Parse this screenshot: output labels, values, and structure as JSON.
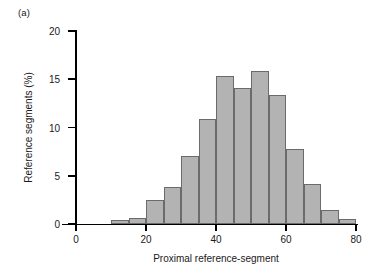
{
  "figure": {
    "panel_label": "(a)",
    "accent_bar_fill": "#b3b3b3",
    "accent_bar_stroke": "#6b6b6b",
    "axis_color": "#000000"
  },
  "chart_data": {
    "type": "bar",
    "title": "",
    "subtitle": "",
    "panel": "(a)",
    "xlabel": "Proximal reference-segment",
    "ylabel": "Reference segments (%)",
    "xlim": [
      0,
      80
    ],
    "ylim": [
      0,
      20
    ],
    "xticks": [
      0,
      20,
      40,
      60,
      80
    ],
    "xtick_labels": [
      "0",
      "20",
      "40",
      "60",
      "80"
    ],
    "yticks": [
      0,
      5,
      10,
      15,
      20
    ],
    "ytick_labels": [
      "0",
      "5",
      "10",
      "15",
      "20"
    ],
    "grid": false,
    "legend": null,
    "bin_width": 5,
    "bin_edges": [
      10,
      15,
      20,
      25,
      30,
      35,
      40,
      45,
      50,
      55,
      60,
      65,
      70,
      75,
      80
    ],
    "categories": [
      "10-15",
      "15-20",
      "20-25",
      "25-30",
      "30-35",
      "35-40",
      "40-45",
      "45-50",
      "50-55",
      "55-60",
      "60-65",
      "65-70",
      "70-75",
      "75-80"
    ],
    "x": [
      12.5,
      17.5,
      22.5,
      27.5,
      32.5,
      37.5,
      42.5,
      47.5,
      52.5,
      57.5,
      62.5,
      67.5,
      72.5,
      77.5
    ],
    "values": [
      0.4,
      0.65,
      2.45,
      3.8,
      7.1,
      10.9,
      15.3,
      14.05,
      15.9,
      13.4,
      7.8,
      4.15,
      1.5,
      0.5
    ],
    "annotations": []
  }
}
